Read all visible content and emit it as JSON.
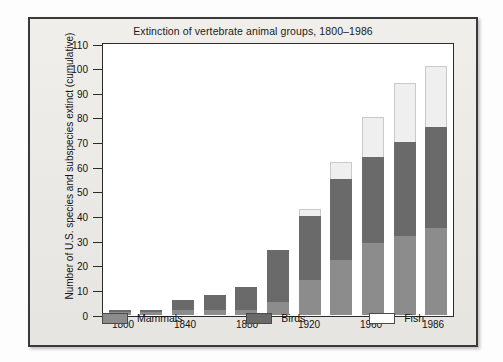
{
  "chart_data": {
    "type": "bar",
    "subtype": "stacked-bar",
    "title": "Extinction of vertebrate animal groups, 1800–1986",
    "xlabel": "",
    "ylabel": "Number of U.S. species and subspecies extinct (cumulative)",
    "ylim": [
      0,
      110
    ],
    "ytick_step": 10,
    "yticks": [
      0,
      10,
      20,
      30,
      40,
      50,
      60,
      70,
      80,
      90,
      100,
      110
    ],
    "ytick_labels": [
      "0",
      "10",
      "20",
      "30",
      "40",
      "50",
      "60",
      "70",
      "80",
      "90",
      "100",
      "110"
    ],
    "grid": false,
    "legend_position": "bottom",
    "categories": [
      "1800",
      "1820",
      "1840",
      "1860",
      "1880",
      "1900",
      "1920",
      "1940",
      "1960",
      "1975",
      "1986"
    ],
    "xtick_labels": [
      "1800",
      "1840",
      "1880",
      "1920",
      "1960",
      "1986"
    ],
    "xtick_category_index": [
      0,
      2,
      4,
      6,
      8,
      10
    ],
    "series": [
      {
        "name": "Mammals",
        "color": "#8c8c8c",
        "values": [
          1,
          1,
          2,
          2,
          2,
          5,
          14,
          22,
          29,
          32,
          35
        ]
      },
      {
        "name": "Birds",
        "color": "#6a6a6a",
        "values": [
          1,
          1,
          4,
          6,
          9,
          21,
          26,
          33,
          35,
          38,
          41
        ]
      },
      {
        "name": "Fish",
        "color": "#ffffff",
        "values": [
          0,
          0,
          0,
          0,
          0,
          0,
          3,
          7,
          16,
          24,
          25
        ]
      }
    ],
    "cumulative_totals": [
      2,
      2,
      6,
      8,
      11,
      26,
      43,
      62,
      80,
      94,
      101
    ]
  },
  "legend": {
    "items": [
      {
        "label": "Mammals",
        "swatch": "mammals"
      },
      {
        "label": "Birds",
        "swatch": "birds"
      },
      {
        "label": "Fish",
        "swatch": "fish"
      }
    ]
  }
}
